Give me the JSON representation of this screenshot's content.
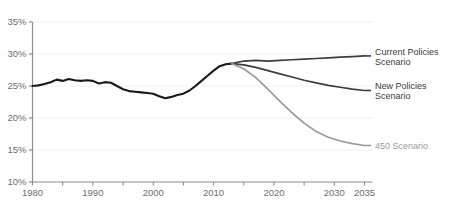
{
  "chart_data": {
    "type": "line",
    "title": "",
    "xlabel": "",
    "ylabel": "",
    "xlim": [
      1980,
      2035
    ],
    "ylim": [
      10,
      35
    ],
    "xticks": [
      "1980",
      "1990",
      "2000",
      "2010",
      "2020",
      "2030",
      "2035"
    ],
    "xtick_values": [
      1980,
      1990,
      2000,
      2010,
      2020,
      2030,
      2035
    ],
    "yticks": [
      "10%",
      "15%",
      "20%",
      "25%",
      "30%",
      "35%"
    ],
    "ytick_values": [
      10,
      15,
      20,
      25,
      30,
      35
    ],
    "grid": true,
    "legend_position": "right",
    "series": [
      {
        "name": "Historical",
        "color": "#1a1a1a",
        "width": 2.1,
        "x": [
          1980,
          1981,
          1982,
          1983,
          1984,
          1985,
          1986,
          1987,
          1988,
          1989,
          1990,
          1991,
          1992,
          1993,
          1994,
          1995,
          1996,
          1997,
          1998,
          1999,
          2000,
          2001,
          2002,
          2003,
          2004,
          2005,
          2006,
          2007,
          2008,
          2009,
          2010,
          2011,
          2012,
          2013
        ],
        "values": [
          25.0,
          25.1,
          25.3,
          25.6,
          26.0,
          25.8,
          26.1,
          25.9,
          25.8,
          25.9,
          25.8,
          25.4,
          25.6,
          25.5,
          25.0,
          24.5,
          24.2,
          24.1,
          24.0,
          23.9,
          23.8,
          23.4,
          23.1,
          23.3,
          23.6,
          23.8,
          24.3,
          25.0,
          25.8,
          26.6,
          27.4,
          28.1,
          28.4,
          28.5
        ]
      },
      {
        "name": "Current Policies Scenario",
        "color": "#3d3d3d",
        "width": 1.7,
        "x": [
          2013,
          2015,
          2017,
          2019,
          2021,
          2023,
          2025,
          2027,
          2029,
          2031,
          2033,
          2035
        ],
        "values": [
          28.5,
          28.9,
          29.0,
          28.9,
          29.0,
          29.1,
          29.2,
          29.3,
          29.4,
          29.5,
          29.6,
          29.7
        ]
      },
      {
        "name": "New Policies Scenario",
        "color": "#3d3d3d",
        "width": 1.7,
        "x": [
          2013,
          2015,
          2017,
          2019,
          2021,
          2023,
          2025,
          2027,
          2029,
          2031,
          2033,
          2035
        ],
        "values": [
          28.5,
          28.3,
          27.9,
          27.4,
          26.9,
          26.4,
          25.9,
          25.5,
          25.1,
          24.8,
          24.5,
          24.3
        ]
      },
      {
        "name": "450 Scenario",
        "color": "#9a9a9a",
        "width": 1.7,
        "x": [
          2013,
          2015,
          2017,
          2019,
          2021,
          2023,
          2025,
          2027,
          2029,
          2031,
          2033,
          2035
        ],
        "values": [
          28.5,
          27.7,
          26.3,
          24.5,
          22.6,
          20.8,
          19.2,
          17.9,
          17.0,
          16.4,
          16.0,
          15.7
        ]
      }
    ]
  },
  "legend": {
    "items": [
      {
        "label_line1": "Current Policies",
        "label_line2": "Scenario",
        "color": "#3d3d3d",
        "muted": false
      },
      {
        "label_line1": "New Policies",
        "label_line2": "Scenario",
        "color": "#3d3d3d",
        "muted": false
      },
      {
        "label_line1": "450 Scenario",
        "label_line2": "",
        "color": "#9a9a9a",
        "muted": true
      }
    ]
  },
  "axis": {
    "y_labels": [
      "35%",
      "30%",
      "25%",
      "20%",
      "15%",
      "10%"
    ],
    "x_labels": [
      "1980",
      "1990",
      "2000",
      "2010",
      "2020",
      "2030",
      "2035"
    ]
  }
}
